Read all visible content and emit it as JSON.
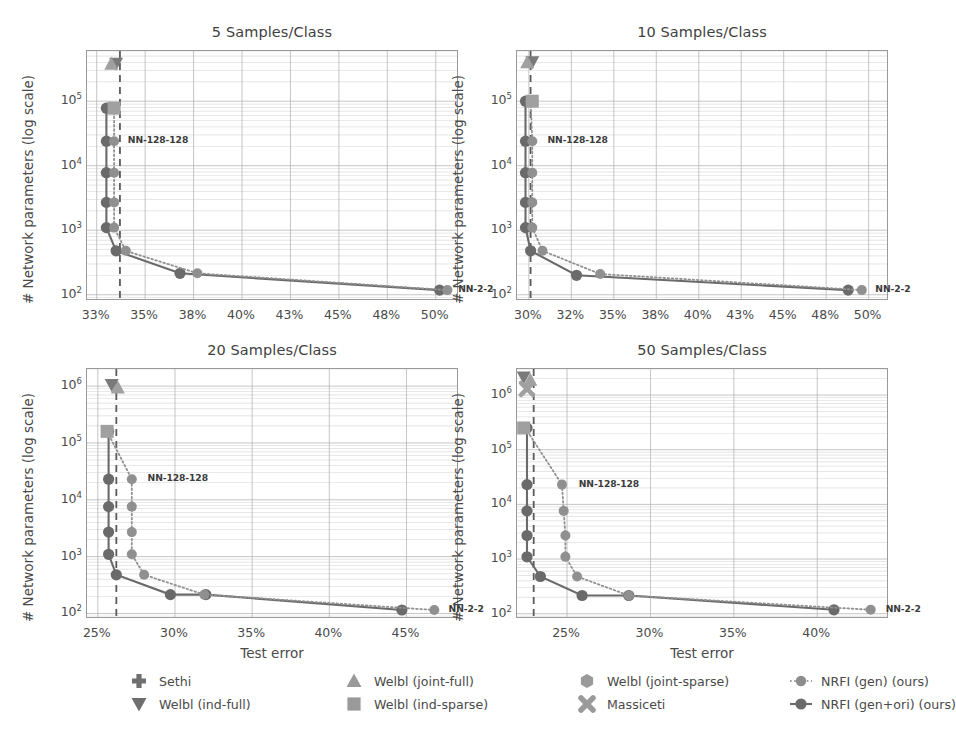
{
  "figure": {
    "axis_labels": {
      "x": "Test error",
      "y": "# Network parameters (log scale)"
    },
    "annotations": {
      "large": "NN-128-128",
      "small": "NN-2-2"
    },
    "colors": {
      "marker_dark": "#6a6a6a",
      "marker_light": "#909090",
      "grid": "#b4b4b4",
      "axis": "#9a9a9a",
      "dashed_baseline": "#5a5a5a",
      "text": "#4a4a4a"
    }
  },
  "legend": {
    "entries": [
      {
        "label": "Sethi",
        "marker": "plus-icon",
        "col": 0,
        "row": 0
      },
      {
        "label": "Welbl (ind-full)",
        "marker": "triangle-down-icon",
        "col": 0,
        "row": 1
      },
      {
        "label": "Welbl (joint-full)",
        "marker": "triangle-up-icon",
        "col": 1,
        "row": 0
      },
      {
        "label": "Welbl (ind-sparse)",
        "marker": "square-icon",
        "col": 1,
        "row": 1
      },
      {
        "label": "Welbl (joint-sparse)",
        "marker": "hexagon-icon",
        "col": 2,
        "row": 0
      },
      {
        "label": "Massiceti",
        "marker": "cross-x-icon",
        "col": 2,
        "row": 1
      },
      {
        "label": "NRFI (gen) (ours)",
        "marker": "dotted-line-circle-icon",
        "col": 3,
        "row": 0
      },
      {
        "label": "NRFI (gen+ori) (ours)",
        "marker": "solid-line-circle-icon",
        "col": 3,
        "row": 1
      }
    ]
  },
  "chart_data": [
    {
      "type": "line",
      "title": "5 Samples/Class",
      "xlabel": "",
      "ylabel": "# Network parameters (log scale)",
      "xlim": [
        32.0,
        51.2
      ],
      "ylim": [
        80,
        600000
      ],
      "xticks": [
        32.5,
        35.0,
        37.5,
        40.0,
        42.5,
        45.0,
        47.5,
        50.0
      ],
      "xticklabels": [
        "33%",
        "35%",
        "38%",
        "40%",
        "43%",
        "45%",
        "48%",
        "50%"
      ],
      "yticks": [
        100,
        1000,
        10000,
        100000
      ],
      "yticklabels": [
        "10^2",
        "10^3",
        "10^4",
        "10^5"
      ],
      "grid": true,
      "baseline_x": 33.7,
      "series": [
        {
          "name": "NRFI (gen+ori) (ours)",
          "style": "solid",
          "x": [
            33.0,
            33.0,
            33.0,
            33.0,
            33.0,
            33.5,
            36.8,
            50.2
          ],
          "y": [
            78000,
            24000,
            7800,
            2700,
            1100,
            480,
            215,
            118
          ]
        },
        {
          "name": "NRFI (gen) (ours)",
          "style": "dotted",
          "x": [
            33.4,
            33.4,
            33.4,
            33.4,
            33.4,
            34.0,
            37.7,
            50.6
          ],
          "y": [
            78000,
            24000,
            7800,
            2700,
            1100,
            480,
            215,
            118
          ]
        }
      ],
      "refpoints": [
        {
          "name": "Welbl (ind-full)",
          "marker": "triangle-down-icon",
          "x": 33.5,
          "y": 380000
        },
        {
          "name": "Welbl (joint-full)",
          "marker": "triangle-up-icon",
          "x": 33.25,
          "y": 380000
        },
        {
          "name": "Welbl (ind-sparse)",
          "marker": "square-icon",
          "x": 33.4,
          "y": 78000
        }
      ],
      "annotations": [
        {
          "text": "NN-128-128",
          "x": 33.85,
          "y": 24000
        },
        {
          "text": "NN-2-2",
          "x": 50.9,
          "y": 118
        }
      ]
    },
    {
      "type": "line",
      "title": "10 Samples/Class",
      "xlabel": "",
      "ylabel": "# Network parameters (log scale)",
      "xlim": [
        29.3,
        51.2
      ],
      "ylim": [
        80,
        600000
      ],
      "xticks": [
        30.0,
        32.5,
        35.0,
        37.5,
        40.0,
        42.5,
        45.0,
        47.5,
        50.0
      ],
      "xticklabels": [
        "30%",
        "32%",
        "35%",
        "38%",
        "40%",
        "43%",
        "45%",
        "48%",
        "50%"
      ],
      "yticks": [
        100,
        1000,
        10000,
        100000
      ],
      "yticklabels": [
        "10^2",
        "10^3",
        "10^4",
        "10^5"
      ],
      "grid": true,
      "baseline_x": 30.1,
      "series": [
        {
          "name": "NRFI (gen+ori) (ours)",
          "style": "solid",
          "x": [
            29.8,
            29.8,
            29.8,
            29.8,
            29.8,
            30.1,
            32.8,
            48.8
          ],
          "y": [
            100000,
            24000,
            7800,
            2700,
            1100,
            480,
            200,
            118
          ]
        },
        {
          "name": "NRFI (gen) (ours)",
          "style": "dotted",
          "x": [
            30.1,
            30.2,
            30.2,
            30.2,
            30.2,
            30.8,
            34.2,
            49.6
          ],
          "y": [
            100000,
            24000,
            7800,
            2700,
            1100,
            480,
            210,
            118
          ]
        }
      ],
      "refpoints": [
        {
          "name": "Welbl (ind-full)",
          "marker": "triangle-down-icon",
          "x": 30.2,
          "y": 400000
        },
        {
          "name": "Welbl (joint-full)",
          "marker": "triangle-up-icon",
          "x": 29.9,
          "y": 400000
        },
        {
          "name": "Welbl (ind-sparse)",
          "marker": "square-icon",
          "x": 30.2,
          "y": 100000
        }
      ],
      "annotations": [
        {
          "text": "NN-128-128",
          "x": 30.8,
          "y": 24000
        },
        {
          "text": "NN-2-2",
          "x": 50.1,
          "y": 118
        }
      ]
    },
    {
      "type": "line",
      "title": "20 Samples/Class",
      "xlabel": "Test error",
      "ylabel": "# Network parameters (log scale)",
      "xlim": [
        24.3,
        48.4
      ],
      "ylim": [
        80,
        2000000
      ],
      "xticks": [
        25,
        30,
        35,
        40,
        45
      ],
      "xticklabels": [
        "25%",
        "30%",
        "35%",
        "40%",
        "45%"
      ],
      "yticks": [
        100,
        1000,
        10000,
        100000,
        1000000
      ],
      "yticklabels": [
        "10^2",
        "10^3",
        "10^4",
        "10^5",
        "10^6"
      ],
      "grid": true,
      "baseline_x": 26.2,
      "series": [
        {
          "name": "NRFI (gen+ori) (ours)",
          "style": "solid",
          "x": [
            25.7,
            25.7,
            25.7,
            25.7,
            25.7,
            26.2,
            29.7,
            32.0,
            44.7
          ],
          "y": [
            160000,
            23000,
            7600,
            2700,
            1100,
            480,
            215,
            215,
            115
          ]
        },
        {
          "name": "NRFI (gen) (ours)",
          "style": "dotted",
          "x": [
            25.6,
            27.2,
            27.2,
            27.2,
            27.2,
            28.0,
            31.9,
            46.8
          ],
          "y": [
            160000,
            23000,
            7600,
            2700,
            1100,
            480,
            215,
            115
          ]
        }
      ],
      "refpoints": [
        {
          "name": "Welbl (ind-full)",
          "marker": "triangle-down-icon",
          "x": 25.9,
          "y": 1050000
        },
        {
          "name": "Welbl (joint-full)",
          "marker": "triangle-up-icon",
          "x": 26.3,
          "y": 950000
        },
        {
          "name": "Welbl (ind-sparse)",
          "marker": "square-icon",
          "x": 25.6,
          "y": 160000
        }
      ],
      "annotations": [
        {
          "text": "NN-128-128",
          "x": 27.9,
          "y": 23000
        },
        {
          "text": "NN-2-2",
          "x": 47.4,
          "y": 115
        }
      ]
    },
    {
      "type": "line",
      "title": "50 Samples/Class",
      "xlabel": "Test error",
      "ylabel": "# Network parameters (log scale)",
      "xlim": [
        22.0,
        44.3
      ],
      "ylim": [
        80,
        3000000
      ],
      "xticks": [
        25,
        30,
        35,
        40
      ],
      "xticklabels": [
        "25%",
        "30%",
        "35%",
        "40%"
      ],
      "yticks": [
        100,
        1000,
        10000,
        100000,
        1000000
      ],
      "yticklabels": [
        "10^2",
        "10^3",
        "10^4",
        "10^5",
        "10^6"
      ],
      "grid": true,
      "baseline_x": 23.0,
      "series": [
        {
          "name": "NRFI (gen+ori) (ours)",
          "style": "solid",
          "x": [
            22.6,
            22.6,
            22.6,
            22.6,
            22.6,
            23.4,
            25.9,
            28.7,
            41.0
          ],
          "y": [
            250000,
            23000,
            7600,
            2700,
            1100,
            480,
            215,
            215,
            118
          ]
        },
        {
          "name": "NRFI (gen) (ours)",
          "style": "dotted",
          "x": [
            22.5,
            24.7,
            24.8,
            24.9,
            24.9,
            25.6,
            28.7,
            43.2
          ],
          "y": [
            250000,
            23000,
            7600,
            2700,
            1100,
            480,
            215,
            118
          ]
        }
      ],
      "refpoints": [
        {
          "name": "Welbl (ind-full)",
          "marker": "triangle-down-icon",
          "x": 22.4,
          "y": 2100000
        },
        {
          "name": "Welbl (joint-full)",
          "marker": "triangle-up-icon",
          "x": 22.8,
          "y": 1900000
        },
        {
          "name": "Massiceti",
          "marker": "cross-x-icon",
          "x": 22.6,
          "y": 1300000
        },
        {
          "name": "Welbl (ind-sparse)",
          "marker": "square-icon",
          "x": 22.4,
          "y": 250000
        }
      ],
      "annotations": [
        {
          "text": "NN-128-128",
          "x": 25.4,
          "y": 23000
        },
        {
          "text": "NN-2-2",
          "x": 43.8,
          "y": 118
        }
      ]
    }
  ]
}
